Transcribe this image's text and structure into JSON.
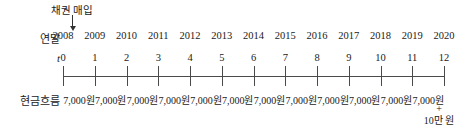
{
  "diagram": {
    "type": "cash-flow-timeline",
    "background": "#ffffff",
    "line_color": "#4a4a4a",
    "text_color": "#1a1a1a",
    "annotation": {
      "label": "채권 매입",
      "arrow_icon": "down-arrow-icon",
      "points_to_t": "0"
    },
    "row_labels": {
      "year_end": "연말",
      "t": "t",
      "cash_flow": "현금흐름"
    },
    "columns": [
      {
        "year": "2008",
        "t": "0",
        "cash": "",
        "extra_plus": "",
        "extra_amount": ""
      },
      {
        "year": "2009",
        "t": "1",
        "cash": "7,000원",
        "extra_plus": "",
        "extra_amount": ""
      },
      {
        "year": "2010",
        "t": "2",
        "cash": "7,000원",
        "extra_plus": "",
        "extra_amount": ""
      },
      {
        "year": "2011",
        "t": "3",
        "cash": "7,000원",
        "extra_plus": "",
        "extra_amount": ""
      },
      {
        "year": "2012",
        "t": "4",
        "cash": "7,000원",
        "extra_plus": "",
        "extra_amount": ""
      },
      {
        "year": "2013",
        "t": "5",
        "cash": "7,000원",
        "extra_plus": "",
        "extra_amount": ""
      },
      {
        "year": "2014",
        "t": "6",
        "cash": "7,000원",
        "extra_plus": "",
        "extra_amount": ""
      },
      {
        "year": "2015",
        "t": "7",
        "cash": "7,000원",
        "extra_plus": "",
        "extra_amount": ""
      },
      {
        "year": "2016",
        "t": "8",
        "cash": "7,000원",
        "extra_plus": "",
        "extra_amount": ""
      },
      {
        "year": "2017",
        "t": "9",
        "cash": "7,000원",
        "extra_plus": "",
        "extra_amount": ""
      },
      {
        "year": "2018",
        "t": "10",
        "cash": "7,000원",
        "extra_plus": "",
        "extra_amount": ""
      },
      {
        "year": "2019",
        "t": "11",
        "cash": "7,000원",
        "extra_plus": "",
        "extra_amount": ""
      },
      {
        "year": "2020",
        "t": "12",
        "cash": "7,000원",
        "extra_plus": "+",
        "extra_amount": "10만 원"
      }
    ]
  }
}
